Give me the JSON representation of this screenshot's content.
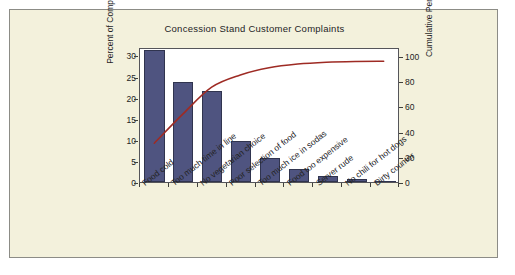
{
  "chart_data": {
    "type": "bar",
    "title": "Concession Stand Customer Complaints",
    "xlabel": "",
    "ylabel": "Percent of Complaints",
    "y2label": "Cumulative Percent",
    "ylim": [
      0,
      32
    ],
    "y2lim": [
      0,
      107
    ],
    "yticks": [
      0,
      5,
      10,
      15,
      20,
      25,
      30
    ],
    "y2ticks": [
      0,
      20,
      40,
      60,
      80,
      100
    ],
    "grid": false,
    "legend": false,
    "categories": [
      "Food cold",
      "Too much time in line",
      "No vegetarian choice",
      "Poor selection of food",
      "Too much ice in sodas",
      "Food too expensive",
      "Server rude",
      "No chili for hot dogs",
      "Dirty counter"
    ],
    "series": [
      {
        "name": "Percent of Complaints",
        "type": "bar",
        "axis": "left",
        "color": "#4f5480",
        "values": [
          31.2,
          23.6,
          21.5,
          9.8,
          5.8,
          3.0,
          1.5,
          0.6,
          0.1
        ]
      },
      {
        "name": "Cumulative Percent",
        "type": "line",
        "axis": "right",
        "color": "#9e2b24",
        "values": [
          31.2,
          54.8,
          76.3,
          86.1,
          91.9,
          94.9,
          96.4,
          97.0,
          97.1
        ]
      }
    ]
  },
  "colors": {
    "panel_background": "#f3f1dc",
    "panel_border": "#8c8c86",
    "plot_background": "#ffffff",
    "plot_border": "#55555a",
    "bar_fill": "#4f5480",
    "bar_edge": "#30344f",
    "curve": "#9e2b24",
    "text": "#23231f"
  }
}
